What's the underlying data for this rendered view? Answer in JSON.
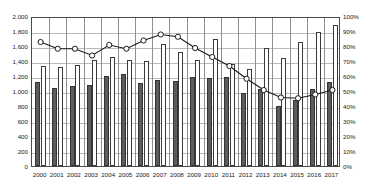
{
  "chart_data": {
    "type": "bar",
    "title": "",
    "subtitle": "",
    "xlabel": "",
    "ylabel": "",
    "y2label": "",
    "grid": true,
    "legend": "none",
    "categories": [
      "2000",
      "2001",
      "2002",
      "2003",
      "2004",
      "2005",
      "2006",
      "2007",
      "2008",
      "2009",
      "2010",
      "2011",
      "2012",
      "2013",
      "2014",
      "2015",
      "2016",
      "2017"
    ],
    "ylim": [
      0,
      2000
    ],
    "y2lim": [
      0,
      100
    ],
    "yticks": [
      "0",
      "200",
      "400",
      "600",
      "800",
      "1,000",
      "1,200",
      "1,400",
      "1,600",
      "1,800",
      "2,000"
    ],
    "y2ticks": [
      "0%",
      "10%",
      "20%",
      "30%",
      "40%",
      "50%",
      "60%",
      "70%",
      "80%",
      "90%",
      "100%"
    ],
    "series": [
      {
        "name": "dark-bars",
        "axis": "left",
        "style": "bar-dark",
        "values": [
          1125,
          1045,
          1065,
          1080,
          1200,
          1225,
          1110,
          1145,
          1135,
          1185,
          1180,
          1185,
          975,
          1030,
          800,
          875,
          1030,
          1120
        ]
      },
      {
        "name": "light-bars",
        "axis": "left",
        "style": "bar-light",
        "values": [
          1340,
          1320,
          1345,
          1420,
          1460,
          1420,
          1400,
          1630,
          1520,
          1410,
          1690,
          1360,
          1300,
          1575,
          1440,
          1650,
          1790,
          1880
        ]
      },
      {
        "name": "ratio-line",
        "axis": "right",
        "style": "line-marker",
        "values": [
          84,
          79.5,
          79.5,
          75,
          82,
          79.5,
          85,
          89,
          87.5,
          80,
          74,
          68,
          59.5,
          52,
          47,
          46.5,
          49,
          52
        ]
      }
    ]
  },
  "colors": {
    "bar_dark": "#5c5c5c",
    "bar_light": "#ffffff",
    "bar_border": "#333333",
    "line": "#1a1a1a",
    "marker_fill": "#ffffff",
    "grid": "#b9b9b9",
    "axis": "#4a4a4a",
    "text": "#1a1a1a",
    "background": "#ffffff"
  }
}
